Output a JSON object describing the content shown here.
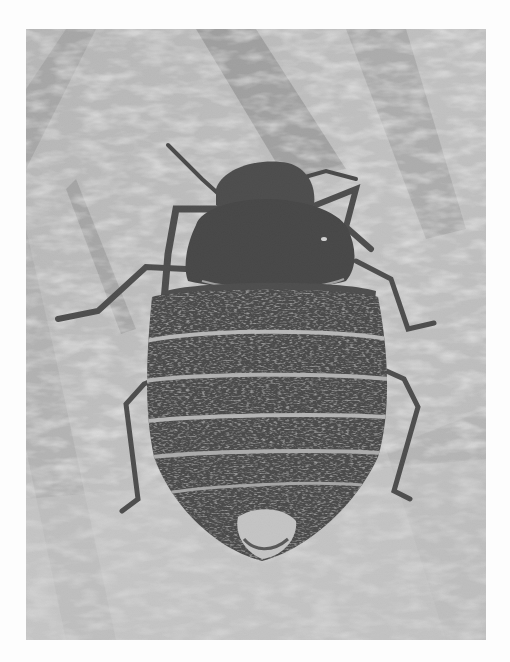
{
  "page": {
    "background": "#fdfdfd",
    "bleed_through_text": "",
    "bleed_through_note": "faint illegible text from reverse side of page"
  },
  "photo": {
    "subject": "bed bug (dorsal view) on textured skin surface",
    "style": "black-and-white halftone photograph",
    "frame": {
      "x": 26,
      "y": 29,
      "width": 460,
      "height": 611
    },
    "colors": {
      "background_light": "#cfcfcf",
      "background_mid": "#a9a9a9",
      "background_dark": "#7c7c7c",
      "body_dark": "#262626",
      "segment_highlight": "#bdbdbd",
      "leg": "#2e2e2e"
    },
    "parts": {
      "head": "head-with-antennae",
      "pronotum": "pronotum",
      "abdomen_segments": 6,
      "legs": 6
    },
    "caption": ""
  }
}
